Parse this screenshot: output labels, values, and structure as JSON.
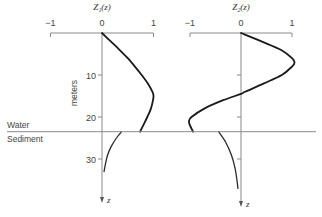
{
  "chart_data": {
    "type": "line",
    "depth_axis": {
      "label": "meters",
      "variable": "z",
      "ticks": [
        10,
        20,
        30
      ],
      "range": [
        0,
        41
      ],
      "direction": "downward"
    },
    "interface": {
      "depth": 23.5,
      "upper_label": "Water",
      "lower_label": "Sediment"
    },
    "panels": [
      {
        "title": "Z₁(z)",
        "xlim": [
          -1,
          1
        ],
        "x_tick_labels": [
          "−1",
          "0",
          "1"
        ],
        "x_ticks": [
          -1,
          0,
          1
        ],
        "water_curve": {
          "z": [
            0,
            2,
            4,
            6,
            8,
            10,
            12,
            14,
            15,
            16,
            18,
            20,
            22,
            23.5
          ],
          "value": [
            0,
            0.17,
            0.34,
            0.5,
            0.64,
            0.77,
            0.89,
            0.98,
            1.0,
            0.99,
            0.95,
            0.88,
            0.8,
            0.74
          ]
        },
        "sediment_curve": {
          "z": [
            23.5,
            25,
            27,
            29,
            31,
            33
          ],
          "value": [
            0.38,
            0.28,
            0.18,
            0.11,
            0.07,
            0.04
          ]
        }
      },
      {
        "title": "Z₂(z)",
        "xlim": [
          -1,
          1
        ],
        "x_tick_labels": [
          "−1",
          "0",
          "1"
        ],
        "x_ticks": [
          -1,
          0,
          1
        ],
        "water_curve": {
          "z": [
            0,
            2,
            4,
            6,
            7,
            8,
            10,
            12,
            14,
            14.5,
            16,
            18,
            20,
            21,
            22,
            23.5
          ],
          "value": [
            0,
            0.4,
            0.78,
            1.0,
            1.05,
            1.0,
            0.8,
            0.45,
            0.08,
            0,
            -0.35,
            -0.72,
            -0.97,
            -1.02,
            -1.0,
            -0.94
          ]
        },
        "sediment_curve": {
          "z": [
            23.5,
            26,
            29,
            32,
            35,
            37
          ],
          "value": [
            -0.44,
            -0.3,
            -0.19,
            -0.12,
            -0.08,
            -0.06
          ]
        }
      }
    ]
  }
}
